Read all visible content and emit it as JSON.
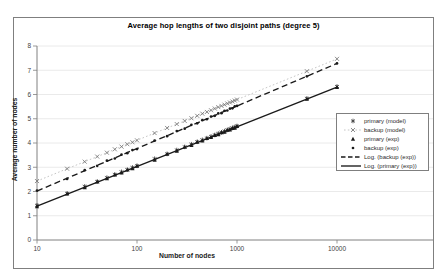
{
  "figure": {
    "title": "Average hop lengths of two disjoint paths (degree 5)"
  },
  "axes": {
    "x": {
      "label": "Number of nodes",
      "scale": "log",
      "ticks": [
        10,
        100,
        1000,
        10000
      ]
    },
    "y": {
      "label": "Average number of nodes",
      "ticks": [
        0,
        1,
        2,
        3,
        4,
        5,
        6,
        7,
        8
      ],
      "range": [
        0,
        8
      ]
    }
  },
  "colors": {
    "marker": "#1a1a1a",
    "model_x_marker": "#6e6e6e",
    "model_dotted_line": "#bfbfbf",
    "axis": "#808080",
    "grid": "#e4e4e4",
    "tick_text": "#3f3f3f"
  },
  "chart_data": {
    "type": "scatter",
    "title": "Average hop lengths of two disjoint paths (degree 5)",
    "xlabel": "Number of nodes",
    "ylabel": "Average number of nodes",
    "x_scale": "log",
    "xlim": [
      10,
      10000
    ],
    "ylim": [
      0,
      8
    ],
    "grid": "horizontal",
    "legend_position": "right-inside",
    "x": [
      10,
      20,
      30,
      40,
      50,
      60,
      70,
      80,
      90,
      100,
      150,
      200,
      250,
      300,
      350,
      400,
      450,
      500,
      550,
      600,
      650,
      700,
      750,
      800,
      850,
      900,
      950,
      1000,
      5000,
      10000
    ],
    "series": [
      {
        "name": "backup (model)",
        "marker": "x",
        "line": "dotted",
        "y": [
          2.43,
          2.94,
          3.23,
          3.44,
          3.6,
          3.74,
          3.85,
          3.95,
          4.03,
          4.11,
          4.41,
          4.62,
          4.78,
          4.91,
          5.02,
          5.12,
          5.21,
          5.28,
          5.35,
          5.42,
          5.48,
          5.53,
          5.58,
          5.63,
          5.67,
          5.71,
          5.75,
          5.79,
          6.96,
          7.47
        ]
      },
      {
        "name": "primary (model)",
        "marker": "asterisk",
        "line": "none",
        "y": [
          1.43,
          1.92,
          2.21,
          2.41,
          2.57,
          2.7,
          2.81,
          2.9,
          2.99,
          3.06,
          3.35,
          3.55,
          3.71,
          3.84,
          3.95,
          4.05,
          4.13,
          4.2,
          4.27,
          4.33,
          4.39,
          4.44,
          4.49,
          4.54,
          4.58,
          4.62,
          4.66,
          4.7,
          5.84,
          6.33
        ]
      },
      {
        "name": "backup (exp)",
        "marker": "dot",
        "line": "none",
        "y": [
          2.04,
          2.52,
          2.88,
          3.06,
          3.27,
          3.36,
          3.52,
          3.58,
          3.71,
          3.75,
          4.1,
          4.28,
          4.49,
          4.59,
          4.75,
          4.81,
          4.94,
          4.98,
          5.09,
          5.12,
          5.22,
          5.23,
          5.33,
          5.34,
          5.42,
          5.43,
          5.51,
          5.53,
          6.75,
          7.28
        ]
      },
      {
        "name": "primary (exp)",
        "marker": "triangle",
        "line": "none",
        "y": [
          1.38,
          1.91,
          2.16,
          2.4,
          2.53,
          2.69,
          2.77,
          2.89,
          2.95,
          3.05,
          3.3,
          3.54,
          3.67,
          3.83,
          3.91,
          4.04,
          4.09,
          4.19,
          4.23,
          4.32,
          4.35,
          4.43,
          4.45,
          4.53,
          4.54,
          4.61,
          4.62,
          4.69,
          5.81,
          6.3
        ]
      }
    ],
    "trendlines": [
      {
        "name": "Log. (backup (exp))",
        "style": "dashed",
        "x1": 10,
        "y1": 2.02,
        "x2": 10000,
        "y2": 7.28
      },
      {
        "name": "Log. (primary (exp))",
        "style": "solid",
        "x1": 10,
        "y1": 1.4,
        "x2": 10000,
        "y2": 6.3
      }
    ],
    "legend_entries": [
      {
        "label": "primary (model)",
        "glyph": "asterisk"
      },
      {
        "label": "backup (model)",
        "glyph": "x-dotted"
      },
      {
        "label": "primary (exp)",
        "glyph": "triangle"
      },
      {
        "label": "backup (exp)",
        "glyph": "dot"
      },
      {
        "label": "Log. (backup (exp))",
        "glyph": "dashed-line"
      },
      {
        "label": "Log. (primary (exp))",
        "glyph": "solid-line"
      }
    ]
  }
}
